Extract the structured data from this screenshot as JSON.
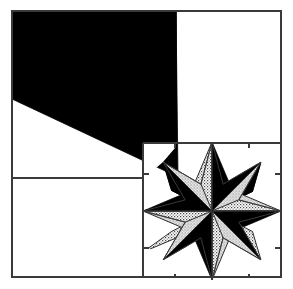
{
  "figure": {
    "canvas": {
      "width": 293,
      "height": 289
    },
    "background_color": "#ffffff",
    "line_color": "#3a3a3a",
    "fill_black": "#000000",
    "fill_stipple_base": "#ffffff",
    "fill_stipple_dot": "#4a4a4a",
    "line_width": 1.2
  },
  "frame": {
    "name": "outer-square-frame",
    "left": 12,
    "top": 11,
    "right": 281,
    "bottom": 277,
    "label": "Outer block border"
  },
  "dividers": [
    {
      "name": "vertical-divider-upper",
      "x1": 176,
      "y1": 11,
      "x2": 176,
      "y2": 143,
      "label": "Upper vertical seam"
    },
    {
      "name": "horizontal-divider-left",
      "x1": 12,
      "y1": 178,
      "x2": 143,
      "y2": 178,
      "label": "Left horizontal seam"
    },
    {
      "name": "horizontal-divider-star-top",
      "x1": 143,
      "y1": 143,
      "x2": 281,
      "y2": 143,
      "label": "Star block top seam"
    },
    {
      "name": "vertical-divider-star-left",
      "x1": 143,
      "y1": 143,
      "x2": 143,
      "y2": 277,
      "label": "Star block left seam"
    },
    {
      "name": "horizontal-divider-star-upper-right",
      "x1": 176,
      "y1": 143,
      "x2": 281,
      "y2": 143,
      "label": "Right pane bottom seam"
    }
  ],
  "black_wedge": {
    "name": "black-wedge-triangle",
    "label": "Large solid black wedge",
    "fill": "#000000",
    "points": "12,11 176,11 178,177 12,99",
    "vertices": [
      {
        "x": 12,
        "y": 11,
        "label": "top-left-corner"
      },
      {
        "x": 176,
        "y": 11,
        "label": "top-seam-corner"
      },
      {
        "x": 178,
        "y": 177,
        "label": "apex-at-star-center-seam"
      },
      {
        "x": 12,
        "y": 99,
        "label": "left-edge-vertex"
      }
    ]
  },
  "star": {
    "name": "eight-pointed-star",
    "label": "Eight-pointed LeMoyne star",
    "center": {
      "x": 212,
      "y": 211
    },
    "outer_radius": 69,
    "inner_radius": 29,
    "point_count": 8,
    "block_bounds": {
      "left": 143,
      "top": 143,
      "right": 281,
      "bottom": 277
    },
    "diamonds": [
      {
        "index": 0,
        "direction": "up",
        "half_a_fill": "stipple",
        "half_b_fill": "black",
        "label": "north diamond"
      },
      {
        "index": 1,
        "direction": "up-right",
        "half_a_fill": "black",
        "half_b_fill": "stipple",
        "label": "northeast diamond"
      },
      {
        "index": 2,
        "direction": "right",
        "half_a_fill": "stipple",
        "half_b_fill": "black",
        "label": "east diamond"
      },
      {
        "index": 3,
        "direction": "down-right",
        "half_a_fill": "black",
        "half_b_fill": "stipple",
        "label": "southeast diamond"
      },
      {
        "index": 4,
        "direction": "down",
        "half_a_fill": "stipple",
        "half_b_fill": "black",
        "label": "south diamond"
      },
      {
        "index": 5,
        "direction": "down-left",
        "half_a_fill": "black",
        "half_b_fill": "stipple",
        "label": "southwest diamond"
      },
      {
        "index": 6,
        "direction": "left",
        "half_a_fill": "stipple",
        "half_b_fill": "black",
        "label": "west diamond"
      },
      {
        "index": 7,
        "direction": "up-left",
        "half_a_fill": "black",
        "half_b_fill": "stipple",
        "label": "northwest diamond"
      }
    ],
    "corner_squares": [
      {
        "name": "star-corner-square-top-left",
        "label": "top-left background square"
      },
      {
        "name": "star-corner-square-top-right",
        "label": "top-right background square"
      },
      {
        "name": "star-corner-square-bottom-left",
        "label": "bottom-left background square"
      },
      {
        "name": "star-corner-square-bottom-right",
        "label": "bottom-right background square"
      }
    ]
  },
  "panes": [
    {
      "name": "pane-upper-left",
      "label": "Upper-left pane (black wedge)"
    },
    {
      "name": "pane-upper-right",
      "label": "Upper-right pane (white)"
    },
    {
      "name": "pane-lower-left",
      "label": "Lower-left pane (white)"
    },
    {
      "name": "pane-lower-right",
      "label": "Lower-right pane (star block)"
    }
  ]
}
